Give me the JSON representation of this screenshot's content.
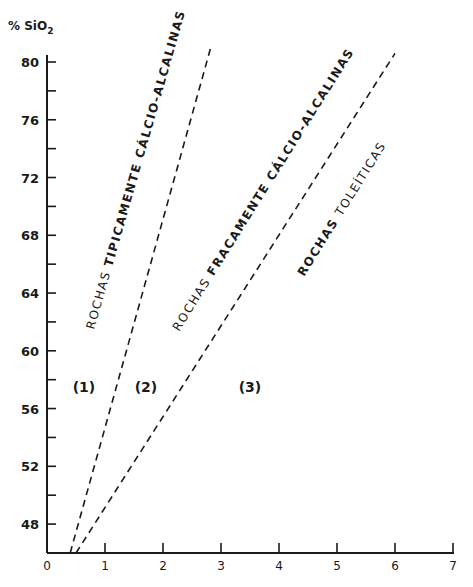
{
  "chart_data": {
    "type": "line",
    "title": "",
    "ylabel": "% SiO2",
    "ylabel_main": "% SiO",
    "ylabel_sub": "2",
    "xlabel": "",
    "xlim": [
      0,
      7
    ],
    "ylim": [
      46,
      80
    ],
    "x_ticks": [
      "0",
      "1",
      "2",
      "3",
      "4",
      "5",
      "6",
      "7"
    ],
    "y_ticks": [
      "48",
      "52",
      "56",
      "60",
      "64",
      "68",
      "72",
      "76",
      "80"
    ],
    "y_minor_ticks": [
      50,
      54,
      58,
      62,
      66,
      70,
      74,
      78
    ],
    "grid": false,
    "series": [
      {
        "name": "boundary-1-2",
        "style": "dashed",
        "x": [
          0.4,
          2.83
        ],
        "y": [
          46,
          81.1
        ]
      },
      {
        "name": "boundary-2-3",
        "style": "dashed",
        "x": [
          0.5,
          6.0
        ],
        "y": [
          46,
          80.6
        ]
      }
    ],
    "annotations": [
      {
        "id": "label1",
        "text_parts": [
          "ROCHAS ",
          "TIPICAMENTE ",
          "CÁLCIO-ALCALINAS"
        ]
      },
      {
        "id": "label2",
        "text_parts": [
          "ROCHAS ",
          "FRACAMENTE ",
          "CÁLCIO-ALCALINAS"
        ]
      },
      {
        "id": "label3",
        "text_parts": [
          "ROCHAS ",
          "TOLEÍTICAS"
        ]
      },
      {
        "id": "region1",
        "text": "(1)"
      },
      {
        "id": "region2",
        "text": "(2)"
      },
      {
        "id": "region3",
        "text": "(3)"
      }
    ]
  }
}
